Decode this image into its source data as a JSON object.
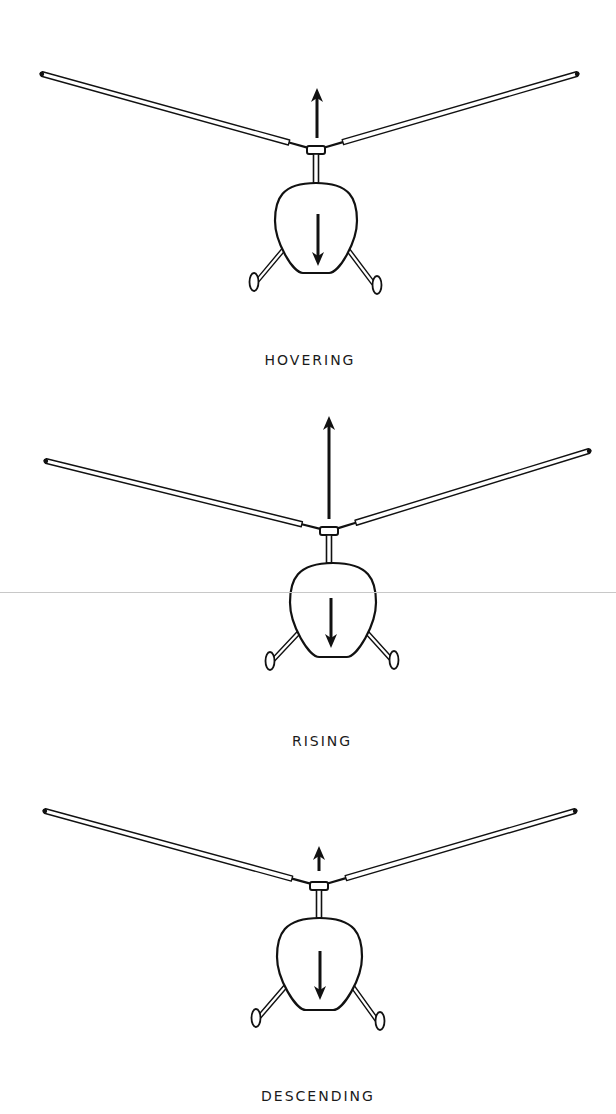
{
  "diagram": {
    "ink_color": "#111111",
    "background": "#ffffff",
    "panels": [
      {
        "id": "hovering",
        "label": "HOVERING",
        "label_pos": [
          310,
          352
        ],
        "hub": [
          316,
          150
        ],
        "left_tip": [
          42,
          74
        ],
        "right_tip": [
          577,
          74
        ],
        "lift_arrow": {
          "from": [
            317,
            138
          ],
          "to": [
            317,
            88
          ],
          "meaning": "lift"
        },
        "fuselage": {
          "top": 183,
          "bottom": 273,
          "left": 275,
          "right": 357
        },
        "weight_arrow": {
          "from": [
            318,
            214
          ],
          "to": [
            318,
            266
          ],
          "meaning": "weight"
        },
        "wheels": [
          [
            254,
            282
          ],
          [
            377,
            285
          ]
        ]
      },
      {
        "id": "rising",
        "label": "RISING",
        "label_pos": [
          322,
          733
        ],
        "hub": [
          329,
          531
        ],
        "left_tip": [
          46,
          461
        ],
        "right_tip": [
          589,
          451
        ],
        "lift_arrow": {
          "from": [
            329,
            519
          ],
          "to": [
            329,
            416
          ],
          "meaning": "lift"
        },
        "fuselage": {
          "top": 563,
          "bottom": 657,
          "left": 290,
          "right": 376
        },
        "weight_arrow": {
          "from": [
            331,
            598
          ],
          "to": [
            331,
            648
          ],
          "meaning": "weight"
        },
        "wheels": [
          [
            270,
            661
          ],
          [
            394,
            660
          ]
        ]
      },
      {
        "id": "descending",
        "label": "DESCENDING",
        "label_pos": [
          318,
          1088
        ],
        "hub": [
          319,
          886
        ],
        "left_tip": [
          45,
          811
        ],
        "right_tip": [
          575,
          811
        ],
        "lift_arrow": {
          "from": [
            319,
            871
          ],
          "to": [
            319,
            846
          ],
          "meaning": "lift"
        },
        "fuselage": {
          "top": 918,
          "bottom": 1010,
          "left": 277,
          "right": 362
        },
        "weight_arrow": {
          "from": [
            320,
            951
          ],
          "to": [
            320,
            1000
          ],
          "meaning": "weight"
        },
        "wheels": [
          [
            256,
            1018
          ],
          [
            380,
            1021
          ]
        ]
      }
    ]
  }
}
